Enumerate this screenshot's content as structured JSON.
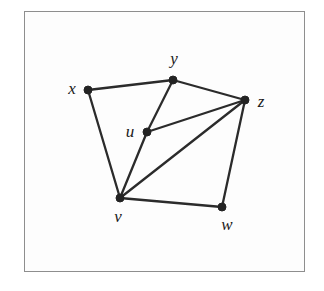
{
  "figure": {
    "kind": "undirected-graph-diagram",
    "frame": {
      "x": 24,
      "y": 11,
      "width": 281,
      "height": 261,
      "border_color": "#8e8e8e",
      "background_color": "#fdfdfd"
    },
    "style": {
      "edge_color": "#2b2b2b",
      "edge_width": 2.3,
      "vertex_color": "#232323",
      "vertex_radius": 4,
      "label_color": "#1a1a1a",
      "label_font_size": 17,
      "page_background": "#ffffff"
    }
  },
  "chart_data": {
    "type": "diagram",
    "title": "",
    "xlabel": "",
    "ylabel": "",
    "nodes": [
      {
        "id": "x",
        "label": "x",
        "x": 88,
        "y": 90,
        "label_x": 72,
        "label_y": 88
      },
      {
        "id": "y",
        "label": "y",
        "x": 173,
        "y": 80,
        "label_x": 174,
        "label_y": 58
      },
      {
        "id": "z",
        "label": "z",
        "x": 245,
        "y": 100,
        "label_x": 261,
        "label_y": 101
      },
      {
        "id": "u",
        "label": "u",
        "x": 147,
        "y": 132,
        "label_x": 130,
        "label_y": 131
      },
      {
        "id": "v",
        "label": "v",
        "x": 120,
        "y": 198,
        "label_x": 118,
        "label_y": 216
      },
      {
        "id": "w",
        "label": "w",
        "x": 222,
        "y": 207,
        "label_x": 227,
        "label_y": 224
      }
    ],
    "edges": [
      {
        "from": "x",
        "to": "y"
      },
      {
        "from": "x",
        "to": "v"
      },
      {
        "from": "y",
        "to": "u"
      },
      {
        "from": "y",
        "to": "z"
      },
      {
        "from": "u",
        "to": "v"
      },
      {
        "from": "u",
        "to": "z"
      },
      {
        "from": "v",
        "to": "z"
      },
      {
        "from": "v",
        "to": "w"
      },
      {
        "from": "w",
        "to": "z"
      }
    ],
    "node_count": 6,
    "edge_count": 9
  }
}
